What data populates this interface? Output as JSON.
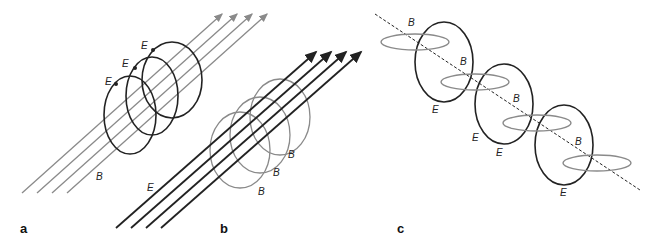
{
  "figure": {
    "panels": [
      {
        "id": "a",
        "label": "a",
        "description": "Straight magnetic field lines (B) surrounded by circulating electric field loops (E)"
      },
      {
        "id": "b",
        "label": "b",
        "description": "Straight electric field lines (E) surrounded by circulating magnetic field loops (B)"
      },
      {
        "id": "c",
        "label": "c",
        "description": "Alternating interlinked E and B loops along a propagation axis (dashed line)"
      }
    ],
    "labels": {
      "a": {
        "E1": "E",
        "E2": "E",
        "E3": "E",
        "B": "B"
      },
      "b": {
        "E": "E",
        "B1": "B",
        "B2": "B",
        "B3": "B"
      },
      "c": {
        "B1": "B",
        "B2": "B",
        "B3": "B",
        "B4": "B",
        "E1": "E",
        "E2": "E",
        "E3": "E",
        "E4": "E"
      }
    },
    "colors": {
      "dark": "#222222",
      "gray": "#8a8a8a"
    }
  }
}
